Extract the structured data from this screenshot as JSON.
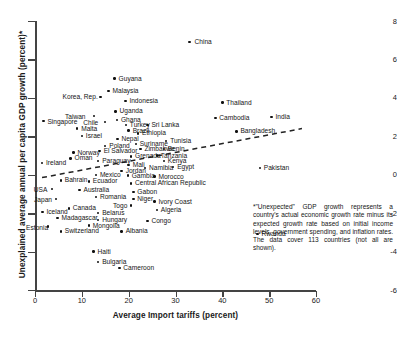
{
  "chart_data": {
    "type": "scatter",
    "title": "",
    "xlabel": "Average Import tariffs (percent)",
    "ylabel": "Unexplained average annual per capita GDP growth (percent)*",
    "xlim": [
      0,
      60
    ],
    "ylim": [
      -6,
      8
    ],
    "xticks": [
      0,
      10,
      20,
      30,
      40,
      50,
      60
    ],
    "yticks": [
      8,
      6,
      4,
      2,
      0,
      -2,
      -4,
      -6
    ],
    "grid": false,
    "legend": null,
    "trendline": {
      "style": "dashed",
      "x": [
        1.5,
        57.0
      ],
      "y": [
        -0.15,
        2.4
      ]
    },
    "points": [
      {
        "label": "China",
        "x": 33.0,
        "y": 6.9,
        "lx": 5,
        "ly": -4
      },
      {
        "label": "Guyana",
        "x": 17.0,
        "y": 5.0,
        "lx": 4,
        "ly": -4
      },
      {
        "label": "Malaysia",
        "x": 15.7,
        "y": 4.35,
        "lx": 4,
        "ly": -4
      },
      {
        "label": "Korea, Rep.",
        "x": 14.0,
        "y": 4.05,
        "lx": -38,
        "ly": -4
      },
      {
        "label": "Indonesia",
        "x": 19.3,
        "y": 3.85,
        "lx": 4,
        "ly": -4
      },
      {
        "label": "Thailand",
        "x": 40.0,
        "y": 3.75,
        "lx": 4,
        "ly": -4
      },
      {
        "label": "Uganda",
        "x": 17.2,
        "y": 3.3,
        "lx": 4,
        "ly": -4
      },
      {
        "label": "Taiwan",
        "x": 12.6,
        "y": 3.05,
        "lx": -29,
        "ly": -3
      },
      {
        "label": "Cambodia",
        "x": 38.5,
        "y": 2.95,
        "lx": 4,
        "ly": -4
      },
      {
        "label": "India",
        "x": 50.5,
        "y": 3.0,
        "lx": 4,
        "ly": -4
      },
      {
        "label": "Ghana",
        "x": 17.5,
        "y": 2.85,
        "lx": 4,
        "ly": -4
      },
      {
        "label": "Singapore",
        "x": 1.8,
        "y": 2.8,
        "lx": 4,
        "ly": -3
      },
      {
        "label": "Chile",
        "x": 15.0,
        "y": 2.75,
        "lx": -22,
        "ly": -3
      },
      {
        "label": "Turkey",
        "x": 19.4,
        "y": 2.6,
        "lx": 4,
        "ly": -4
      },
      {
        "label": "Sri Lanka",
        "x": 24.0,
        "y": 2.6,
        "lx": 4,
        "ly": -4
      },
      {
        "label": "Malta",
        "x": 9.0,
        "y": 2.4,
        "lx": 4,
        "ly": -4
      },
      {
        "label": "Brazil",
        "x": 20.0,
        "y": 2.3,
        "lx": 4,
        "ly": -4
      },
      {
        "label": "Bangladesh",
        "x": 43.0,
        "y": 2.25,
        "lx": 4,
        "ly": -4
      },
      {
        "label": "Ethiopia",
        "x": 22.0,
        "y": 2.15,
        "lx": 4,
        "ly": -4
      },
      {
        "label": "Israel",
        "x": 10.0,
        "y": 2.0,
        "lx": 4,
        "ly": -4
      },
      {
        "label": "Nepal",
        "x": 17.6,
        "y": 1.85,
        "lx": 4,
        "ly": -4
      },
      {
        "label": "Tunisia",
        "x": 28.0,
        "y": 1.75,
        "lx": 4,
        "ly": -4
      },
      {
        "label": "Suriname",
        "x": 21.5,
        "y": 1.6,
        "lx": 4,
        "ly": -4
      },
      {
        "label": "Poland",
        "x": 15.0,
        "y": 1.5,
        "lx": 4,
        "ly": -4
      },
      {
        "label": "Zimbabwe",
        "x": 22.5,
        "y": 1.35,
        "lx": 4,
        "ly": -4
      },
      {
        "label": "Benin",
        "x": 27.5,
        "y": 1.35,
        "lx": 4,
        "ly": -4
      },
      {
        "label": "El Salvador",
        "x": 13.8,
        "y": 1.25,
        "lx": 4,
        "ly": -4
      },
      {
        "label": "Norway",
        "x": 8.2,
        "y": 1.15,
        "lx": 4,
        "ly": -4
      },
      {
        "label": "Tanzania",
        "x": 26.0,
        "y": 1.0,
        "lx": 4,
        "ly": -4
      },
      {
        "label": "Grenada",
        "x": 20.5,
        "y": 0.95,
        "lx": 4,
        "ly": -4
      },
      {
        "label": "Oman",
        "x": 7.6,
        "y": 0.85,
        "lx": 4,
        "ly": -4
      },
      {
        "label": "Paraguay",
        "x": 13.5,
        "y": 0.7,
        "lx": 4,
        "ly": -4
      },
      {
        "label": "Kenya",
        "x": 27.5,
        "y": 0.72,
        "lx": 4,
        "ly": -4
      },
      {
        "label": "Ireland",
        "x": 1.5,
        "y": 0.6,
        "lx": 4,
        "ly": -4
      },
      {
        "label": "Mali",
        "x": 20.0,
        "y": 0.5,
        "lx": 4,
        "ly": -4
      },
      {
        "label": "Namibia",
        "x": 23.5,
        "y": 0.35,
        "lx": 4,
        "ly": -4
      },
      {
        "label": "Egypt",
        "x": 29.5,
        "y": 0.4,
        "lx": 4,
        "ly": -4
      },
      {
        "label": "Jordan",
        "x": 18.5,
        "y": 0.2,
        "lx": 4,
        "ly": -4
      },
      {
        "label": "Mexico",
        "x": 13.0,
        "y": 0.0,
        "lx": 4,
        "ly": -4
      },
      {
        "label": "Gambia",
        "x": 19.8,
        "y": -0.05,
        "lx": 4,
        "ly": -4
      },
      {
        "label": "Morocco",
        "x": 25.5,
        "y": -0.1,
        "lx": 4,
        "ly": -4
      },
      {
        "label": "Bahrain",
        "x": 5.5,
        "y": -0.3,
        "lx": 4,
        "ly": -4
      },
      {
        "label": "Ecuador",
        "x": 11.5,
        "y": -0.35,
        "lx": 4,
        "ly": -4
      },
      {
        "label": "Central African Republic",
        "x": 20.5,
        "y": -0.45,
        "lx": 4,
        "ly": -4
      },
      {
        "label": "USA",
        "x": 3.6,
        "y": -0.75,
        "lx": -18,
        "ly": -3
      },
      {
        "label": "Australia",
        "x": 9.5,
        "y": -0.8,
        "lx": 4,
        "ly": -4
      },
      {
        "label": "Gabon",
        "x": 21.0,
        "y": -0.9,
        "lx": 4,
        "ly": -4
      },
      {
        "label": "Japan",
        "x": 4.5,
        "y": -1.25,
        "lx": -22,
        "ly": -3
      },
      {
        "label": "Romania",
        "x": 13.0,
        "y": -1.15,
        "lx": 4,
        "ly": -4
      },
      {
        "label": "Niger",
        "x": 21.0,
        "y": -1.25,
        "lx": 4,
        "ly": -4
      },
      {
        "label": "Ivory Coast",
        "x": 25.5,
        "y": -1.4,
        "lx": 4,
        "ly": -4
      },
      {
        "label": "Togo",
        "x": 20.5,
        "y": -1.6,
        "lx": -18,
        "ly": -3
      },
      {
        "label": "Canada",
        "x": 7.2,
        "y": -1.75,
        "lx": 4,
        "ly": -4
      },
      {
        "label": "Iceland",
        "x": 1.6,
        "y": -1.95,
        "lx": 4,
        "ly": -4
      },
      {
        "label": "Algeria",
        "x": 26.0,
        "y": -1.85,
        "lx": 4,
        "ly": -4
      },
      {
        "label": "Belarus",
        "x": 13.5,
        "y": -2.0,
        "lx": 4,
        "ly": -4
      },
      {
        "label": "Madagascar",
        "x": 4.8,
        "y": -2.25,
        "lx": 4,
        "ly": -4
      },
      {
        "label": "Hungary",
        "x": 13.5,
        "y": -2.35,
        "lx": 4,
        "ly": -4
      },
      {
        "label": "Congo",
        "x": 24.0,
        "y": -2.4,
        "lx": 4,
        "ly": -4
      },
      {
        "label": "Estonia",
        "x": 2.8,
        "y": -2.7,
        "lx": -22,
        "ly": -3
      },
      {
        "label": "Mongolia",
        "x": 11.5,
        "y": -2.65,
        "lx": 4,
        "ly": -4
      },
      {
        "label": "Switzerland",
        "x": 5.5,
        "y": -2.95,
        "lx": 4,
        "ly": -4
      },
      {
        "label": "Albania",
        "x": 18.5,
        "y": -2.95,
        "lx": 4,
        "ly": -4
      },
      {
        "label": "Rwanda",
        "x": 47.5,
        "y": -3.1,
        "lx": 4,
        "ly": -4
      },
      {
        "label": "Haiti",
        "x": 12.5,
        "y": -4.0,
        "lx": 4,
        "ly": -4
      },
      {
        "label": "Bulgaria",
        "x": 13.5,
        "y": -4.55,
        "lx": 4,
        "ly": -4
      },
      {
        "label": "Cameroon",
        "x": 18.0,
        "y": -4.85,
        "lx": 4,
        "ly": -4
      },
      {
        "label": "Pakistan",
        "x": 48.0,
        "y": 0.35,
        "lx": 4,
        "ly": -4
      }
    ]
  },
  "note": "*\"Unexpected\" GDP growth represents a country's actual economic growth rate minus its expected growth rate based on initial income levels, government spending, and inflation rates. The data cover 113 countries (not all are shown)."
}
